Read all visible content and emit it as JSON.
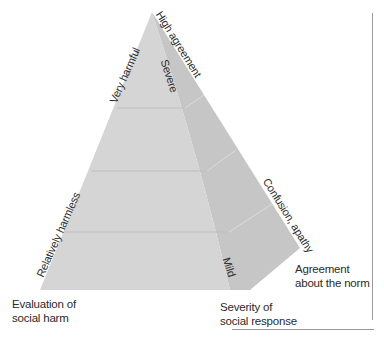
{
  "diagram": {
    "type": "pyramid",
    "apex_labels": {
      "front_edge_top": "Very harmful",
      "front_edge_bottom": "Relatively harmless",
      "right_edge_top": "High agreement",
      "right_edge_bottom": "Confusion, apathy",
      "inner_top": "Severe",
      "inner_bottom": "Mild"
    },
    "axes": {
      "left": "Evaluation of\nsocial harm",
      "left_line1": "Evaluation of",
      "left_line2": "social harm",
      "center_line1": "Severity of",
      "center_line2": "social response",
      "right_line1": "Agreement",
      "right_line2": "about the norm"
    },
    "bands": 4,
    "colors": {
      "front_face": "#d4d4d4",
      "side_face": "#c4c4c4",
      "band_line_front": "#bcbcbc",
      "band_line_side": "#dadada",
      "rule": "#9a9a9a"
    }
  }
}
